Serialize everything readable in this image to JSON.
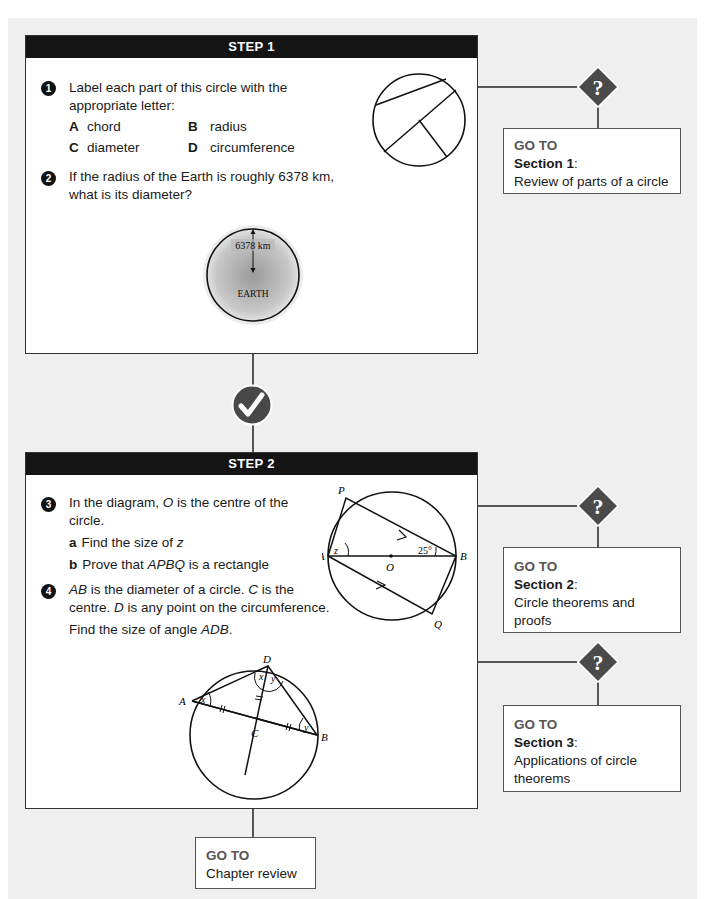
{
  "step1": {
    "header": "STEP 1",
    "q1": {
      "number": "1",
      "text_line1": "Label each part of this circle with the",
      "text_line2": "appropriate letter:",
      "options": [
        {
          "letter": "A",
          "label": "chord"
        },
        {
          "letter": "B",
          "label": "radius"
        },
        {
          "letter": "C",
          "label": "diameter"
        },
        {
          "letter": "D",
          "label": "circumference"
        }
      ]
    },
    "q2": {
      "number": "2",
      "text_line1": "If the radius of the Earth is roughly 6378 km,",
      "text_line2": "what is its diameter?",
      "figure": {
        "radius_label": "6378 km",
        "planet_label": "EARTH"
      }
    }
  },
  "step2": {
    "header": "STEP 2",
    "q3": {
      "number": "3",
      "text_pre": "In the diagram, ",
      "text_var": "O",
      "text_post": " is the centre of the",
      "text_line2": "circle.",
      "parts": [
        {
          "letter": "a",
          "text": "Find the size of ",
          "var": "z",
          "post": ""
        },
        {
          "letter": "b",
          "text": "Prove that ",
          "var": "APBQ",
          "post": " is a rectangle"
        }
      ],
      "figure": {
        "labels": {
          "P": "P",
          "A": "A",
          "O": "O",
          "B": "B",
          "Q": "Q",
          "z": "z",
          "angle": "25°"
        }
      }
    },
    "q4": {
      "number": "4",
      "line1_a": "AB",
      "line1_b": " is the diameter of a circle. ",
      "line1_c": "C",
      "line1_d": " is the",
      "line2_a": "centre. ",
      "line2_b": "D",
      "line2_c": " is any point on the circumference.",
      "line3_a": "Find the size of angle ",
      "line3_b": "ADB",
      "line3_c": ".",
      "figure": {
        "labels": {
          "A": "A",
          "B": "B",
          "C": "C",
          "D": "D",
          "x": "x",
          "y": "y"
        }
      }
    }
  },
  "gotos": [
    {
      "goto": "GO TO",
      "section": "Section 1",
      "desc": "Review of parts of a circle"
    },
    {
      "goto": "GO TO",
      "section": "Section 2",
      "desc": "Circle theorems and proofs"
    },
    {
      "goto": "GO TO",
      "section": "Section 3",
      "desc": "Applications of circle theorems"
    },
    {
      "goto": "GO TO",
      "section": "",
      "desc": "Chapter review"
    }
  ],
  "icons": {
    "question": "?",
    "check": "✓"
  },
  "colors": {
    "header_bg": "#141414",
    "panel_bg": "#efefef",
    "diamond": "#4a4a4a",
    "goto_label": "#555555"
  }
}
